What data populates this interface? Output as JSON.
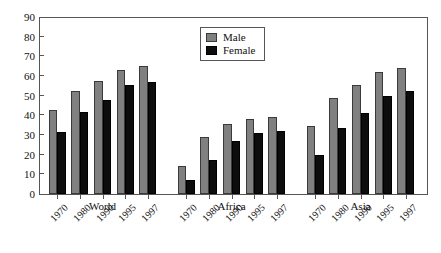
{
  "chart_data": {
    "type": "bar",
    "title": "",
    "subtitle": "",
    "xlabel": "",
    "ylabel": "",
    "ylim": [
      0,
      90
    ],
    "ytick_step": 10,
    "yticks": [
      90,
      80,
      70,
      60,
      50,
      40,
      30,
      20,
      10,
      0
    ],
    "grid": false,
    "legend_position": "top-center",
    "groups": [
      "World",
      "Africa",
      "Asia"
    ],
    "categories": [
      "1970",
      "1980",
      "1990",
      "1995",
      "1997"
    ],
    "series": [
      {
        "name": "Male",
        "color": "#808080",
        "values_by_group": {
          "World": [
            42.5,
            52.5,
            57.5,
            63.0,
            65.0
          ],
          "Africa": [
            14.0,
            29.0,
            35.5,
            38.0,
            39.0
          ],
          "Asia": [
            34.5,
            49.0,
            55.5,
            62.0,
            64.0
          ]
        }
      },
      {
        "name": "Female",
        "color": "#0d0d0d",
        "values_by_group": {
          "World": [
            31.5,
            41.5,
            48.0,
            55.5,
            57.0
          ],
          "Africa": [
            7.0,
            17.5,
            27.0,
            31.0,
            32.0
          ],
          "Asia": [
            20.0,
            33.5,
            41.0,
            50.0,
            52.5
          ]
        }
      }
    ]
  },
  "legend": {
    "items": [
      {
        "label": "Male",
        "swatch": "male"
      },
      {
        "label": "Female",
        "swatch": "female"
      }
    ]
  },
  "axes": {
    "y_tick_labels": [
      "90",
      "80",
      "70",
      "60",
      "50",
      "40",
      "30",
      "20",
      "10",
      "0"
    ]
  }
}
